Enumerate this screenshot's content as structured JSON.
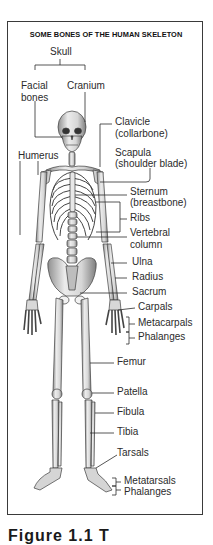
{
  "figure": {
    "title": "SOME BONES OF THE HUMAN SKELETON",
    "caption_partial": "Figure 1.1 T",
    "colors": {
      "line": "#2b2b2b",
      "bone_fill": "#e6e6e6",
      "bone_shade": "#9a9a9a",
      "frame": "#3a3a3a"
    }
  },
  "labels": {
    "skull": "Skull",
    "facial_bones_1": "Facial",
    "facial_bones_2": "bones",
    "cranium": "Cranium",
    "clavicle_1": "Clavicle",
    "clavicle_2": "(collarbone)",
    "humerus": "Humerus",
    "scapula_1": "Scapula",
    "scapula_2": "(shoulder blade)",
    "sternum_1": "Sternum",
    "sternum_2": "(breastbone)",
    "ribs": "Ribs",
    "vertebral_1": "Vertebral",
    "vertebral_2": "column",
    "ulna": "Ulna",
    "radius": "Radius",
    "sacrum": "Sacrum",
    "carpals": "Carpals",
    "metacarpals": "Metacarpals",
    "phalanges_hand": "Phalanges",
    "femur": "Femur",
    "patella": "Patella",
    "fibula": "Fibula",
    "tibia": "Tibia",
    "tarsals": "Tarsals",
    "metatarsals": "Metatarsals",
    "phalanges_foot": "Phalanges"
  }
}
